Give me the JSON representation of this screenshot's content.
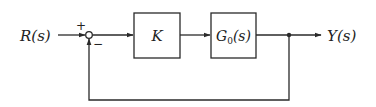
{
  "diagram": {
    "type": "feedback-control-block-diagram",
    "input": {
      "label": "R(s)"
    },
    "output": {
      "label": "Y(s)"
    },
    "summing_junction": {
      "plus_sign": "+",
      "minus_sign": "−"
    },
    "blocks": [
      {
        "id": "controller",
        "label": "K"
      },
      {
        "id": "plant",
        "label": "G₀(s)",
        "main": "G",
        "sub": "0",
        "suffix": "(s)"
      }
    ],
    "feedback": {
      "type": "unity",
      "sign": "negative"
    },
    "colors": {
      "line": "#2a2a2a",
      "background": "#ffffff"
    }
  }
}
